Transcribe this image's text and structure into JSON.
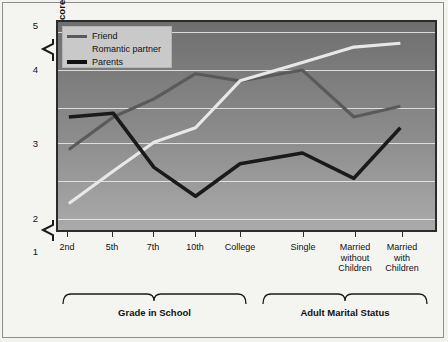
{
  "chart_data": {
    "type": "line",
    "title": "",
    "xlabel": "",
    "ylabel": "Mean Self-Disclosure Score",
    "ylim": [
      1,
      5
    ],
    "yticks": [
      "1",
      "2",
      "3",
      "4",
      "5"
    ],
    "grid": true,
    "axis_break": "between 4 and 5",
    "legend_position": "top-left inside plot",
    "categories": [
      "2nd",
      "5th",
      "7th",
      "10th",
      "College",
      "Single",
      "Married without Children",
      "Married with Children"
    ],
    "category_labels_multiline": [
      [
        "2nd"
      ],
      [
        "5th"
      ],
      [
        "7th"
      ],
      [
        "10th"
      ],
      [
        "College"
      ],
      [
        "Single"
      ],
      [
        "Married",
        "without",
        "Children"
      ],
      [
        "Married",
        "with",
        "Children"
      ]
    ],
    "series": [
      {
        "name": "Friend",
        "color": "#5a5a5a",
        "values": [
          2.9,
          3.35,
          3.6,
          3.95,
          3.85,
          4.0,
          3.35,
          3.5
        ]
      },
      {
        "name": "Romantic partner",
        "color": "#e8e8e8",
        "values": [
          2.15,
          2.6,
          3.0,
          3.2,
          3.85,
          4.2,
          4.6,
          4.7
        ]
      },
      {
        "name": "Parents",
        "color": "#1a1a1a",
        "values": [
          3.35,
          3.4,
          2.65,
          2.25,
          2.7,
          2.85,
          2.5,
          3.2
        ]
      }
    ],
    "groups": [
      {
        "label": "Grade in School",
        "from": "2nd",
        "to": "College"
      },
      {
        "label": "Adult Marital Status",
        "from": "Single",
        "to": "Married with Children"
      }
    ]
  },
  "legend": {
    "items": [
      {
        "label": "Friend",
        "swatch": "line-gray"
      },
      {
        "label": "Romantic partner",
        "swatch": "line-light"
      },
      {
        "label": "Parents",
        "swatch": "line-black"
      }
    ]
  },
  "axis": {
    "y_title": "Mean Self-Disclosure Score",
    "y_tick_5": "5",
    "y_tick_4": "4",
    "y_tick_3": "3",
    "y_tick_2": "2",
    "y_tick_1": "1"
  },
  "groups": {
    "grade": "Grade in School",
    "marital": "Adult Marital Status"
  }
}
